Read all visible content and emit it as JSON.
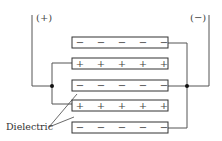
{
  "terminals": {
    "positive_label": "(+)",
    "negative_label": "(−)"
  },
  "plates": [
    {
      "polarity": "negative",
      "signs": [
        "−",
        "−",
        "−",
        "−",
        "−"
      ]
    },
    {
      "polarity": "positive",
      "signs": [
        "+",
        "+",
        "+",
        "+",
        "+"
      ]
    },
    {
      "polarity": "negative",
      "signs": [
        "−",
        "−",
        "−",
        "−",
        "−"
      ]
    },
    {
      "polarity": "positive",
      "signs": [
        "+",
        "+",
        "+",
        "+",
        "+"
      ]
    },
    {
      "polarity": "negative",
      "signs": [
        "−",
        "−",
        "−",
        "−",
        "−"
      ]
    }
  ],
  "dielectric_label": "Dielectric"
}
